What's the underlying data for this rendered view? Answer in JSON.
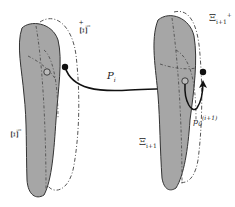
{
  "diagram": {
    "colors": {
      "region_fill": "#a6a6a6",
      "region_stroke": "#333333",
      "dashed_outline": "#555555",
      "arrow": "#111111",
      "background": "#ffffff"
    },
    "left_region": {
      "label_base": "Ξ",
      "label_sub": "i",
      "outline_label_base": "Ξ",
      "outline_label_sub": "i",
      "outline_label_sup": "+"
    },
    "right_region": {
      "label_base": "Ξ",
      "label_sub": "i+1",
      "outline_label_base": "Ξ",
      "outline_label_sub": "i+1",
      "outline_label_sup": "+"
    },
    "transfer_arrow": {
      "label_base": "P",
      "label_sub": "i"
    },
    "local_point": {
      "label_base": "p",
      "label_sub": "0",
      "label_sup": "(i+1)"
    }
  }
}
